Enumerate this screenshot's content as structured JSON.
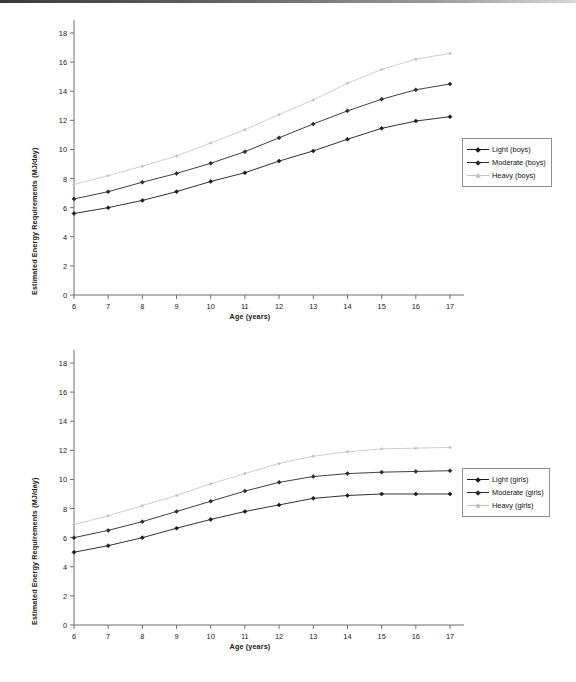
{
  "page": {
    "background_color": "#ffffff",
    "scan_edge_color": "#4a4a4a"
  },
  "charts": [
    {
      "id": "boys",
      "axis": {
        "y_title": "Estimated Energy Requirements (MJ/day)",
        "x_title": "Age (years)",
        "y_ticks": [
          "0",
          "2",
          "4",
          "6",
          "8",
          "10",
          "12",
          "14",
          "16",
          "18"
        ],
        "x_ticks": [
          "6",
          "7",
          "8",
          "9",
          "10",
          "11",
          "12",
          "13",
          "14",
          "15",
          "16",
          "17"
        ]
      },
      "legend": {
        "items": [
          {
            "label": "Light (boys)",
            "color": "#1b1b1b",
            "marker": "diamond"
          },
          {
            "label": "Moderate  (boys)",
            "color": "#2b2b2b",
            "marker": "diamond"
          },
          {
            "label": "Heavy (boys)",
            "color": "#c2c2c2",
            "marker": "diamond"
          }
        ]
      }
    },
    {
      "id": "girls",
      "axis": {
        "y_title": "Estimated Energy Requirements (MJ/day)",
        "x_title": "Age (years)",
        "y_ticks": [
          "0",
          "2",
          "4",
          "6",
          "8",
          "10",
          "12",
          "14",
          "16",
          "18"
        ],
        "x_ticks": [
          "6",
          "7",
          "8",
          "9",
          "10",
          "11",
          "12",
          "13",
          "14",
          "15",
          "16",
          "17"
        ]
      },
      "legend": {
        "items": [
          {
            "label": "Light (girls)",
            "color": "#1b1b1b",
            "marker": "diamond"
          },
          {
            "label": "Moderate (girls)",
            "color": "#2b2b2b",
            "marker": "diamond"
          },
          {
            "label": "Heavy (girls)",
            "color": "#c2c2c2",
            "marker": "diamond"
          }
        ]
      }
    }
  ],
  "chart_data": [
    {
      "type": "line",
      "id": "boys",
      "title": "",
      "xlabel": "Age (years)",
      "ylabel": "Estimated Energy Requirements (MJ/day)",
      "x": [
        6,
        7,
        8,
        9,
        10,
        11,
        12,
        13,
        14,
        15,
        16,
        17
      ],
      "xlim": [
        6,
        17
      ],
      "ylim": [
        0,
        18
      ],
      "ytick_step": 2,
      "grid": false,
      "legend_position": "right",
      "series": [
        {
          "name": "Light (boys)",
          "color": "#1b1b1b",
          "values": [
            5.6,
            6.0,
            6.5,
            7.1,
            7.8,
            8.4,
            9.2,
            9.9,
            10.7,
            11.45,
            11.95,
            12.25
          ]
        },
        {
          "name": "Moderate  (boys)",
          "color": "#2b2b2b",
          "values": [
            6.6,
            7.1,
            7.75,
            8.35,
            9.05,
            9.85,
            10.8,
            11.75,
            12.65,
            13.45,
            14.1,
            14.5
          ]
        },
        {
          "name": "Heavy (boys)",
          "color": "#c2c2c2",
          "values": [
            7.6,
            8.2,
            8.85,
            9.55,
            10.45,
            11.35,
            12.4,
            13.4,
            14.55,
            15.5,
            16.2,
            16.6
          ]
        }
      ]
    },
    {
      "type": "line",
      "id": "girls",
      "title": "",
      "xlabel": "Age (years)",
      "ylabel": "Estimated Energy Requirements (MJ/day)",
      "x": [
        6,
        7,
        8,
        9,
        10,
        11,
        12,
        13,
        14,
        15,
        16,
        17
      ],
      "xlim": [
        6,
        17
      ],
      "ylim": [
        0,
        18
      ],
      "ytick_step": 2,
      "grid": false,
      "legend_position": "right",
      "series": [
        {
          "name": "Light (girls)",
          "color": "#1b1b1b",
          "values": [
            5.0,
            5.45,
            6.0,
            6.65,
            7.25,
            7.8,
            8.25,
            8.7,
            8.9,
            9.0,
            9.0,
            9.0
          ]
        },
        {
          "name": "Moderate (girls)",
          "color": "#2b2b2b",
          "values": [
            6.0,
            6.5,
            7.1,
            7.8,
            8.5,
            9.2,
            9.8,
            10.2,
            10.4,
            10.5,
            10.55,
            10.6
          ]
        },
        {
          "name": "Heavy (girls)",
          "color": "#c2c2c2",
          "values": [
            6.9,
            7.5,
            8.2,
            8.9,
            9.7,
            10.4,
            11.1,
            11.6,
            11.9,
            12.1,
            12.15,
            12.2
          ]
        }
      ]
    }
  ]
}
